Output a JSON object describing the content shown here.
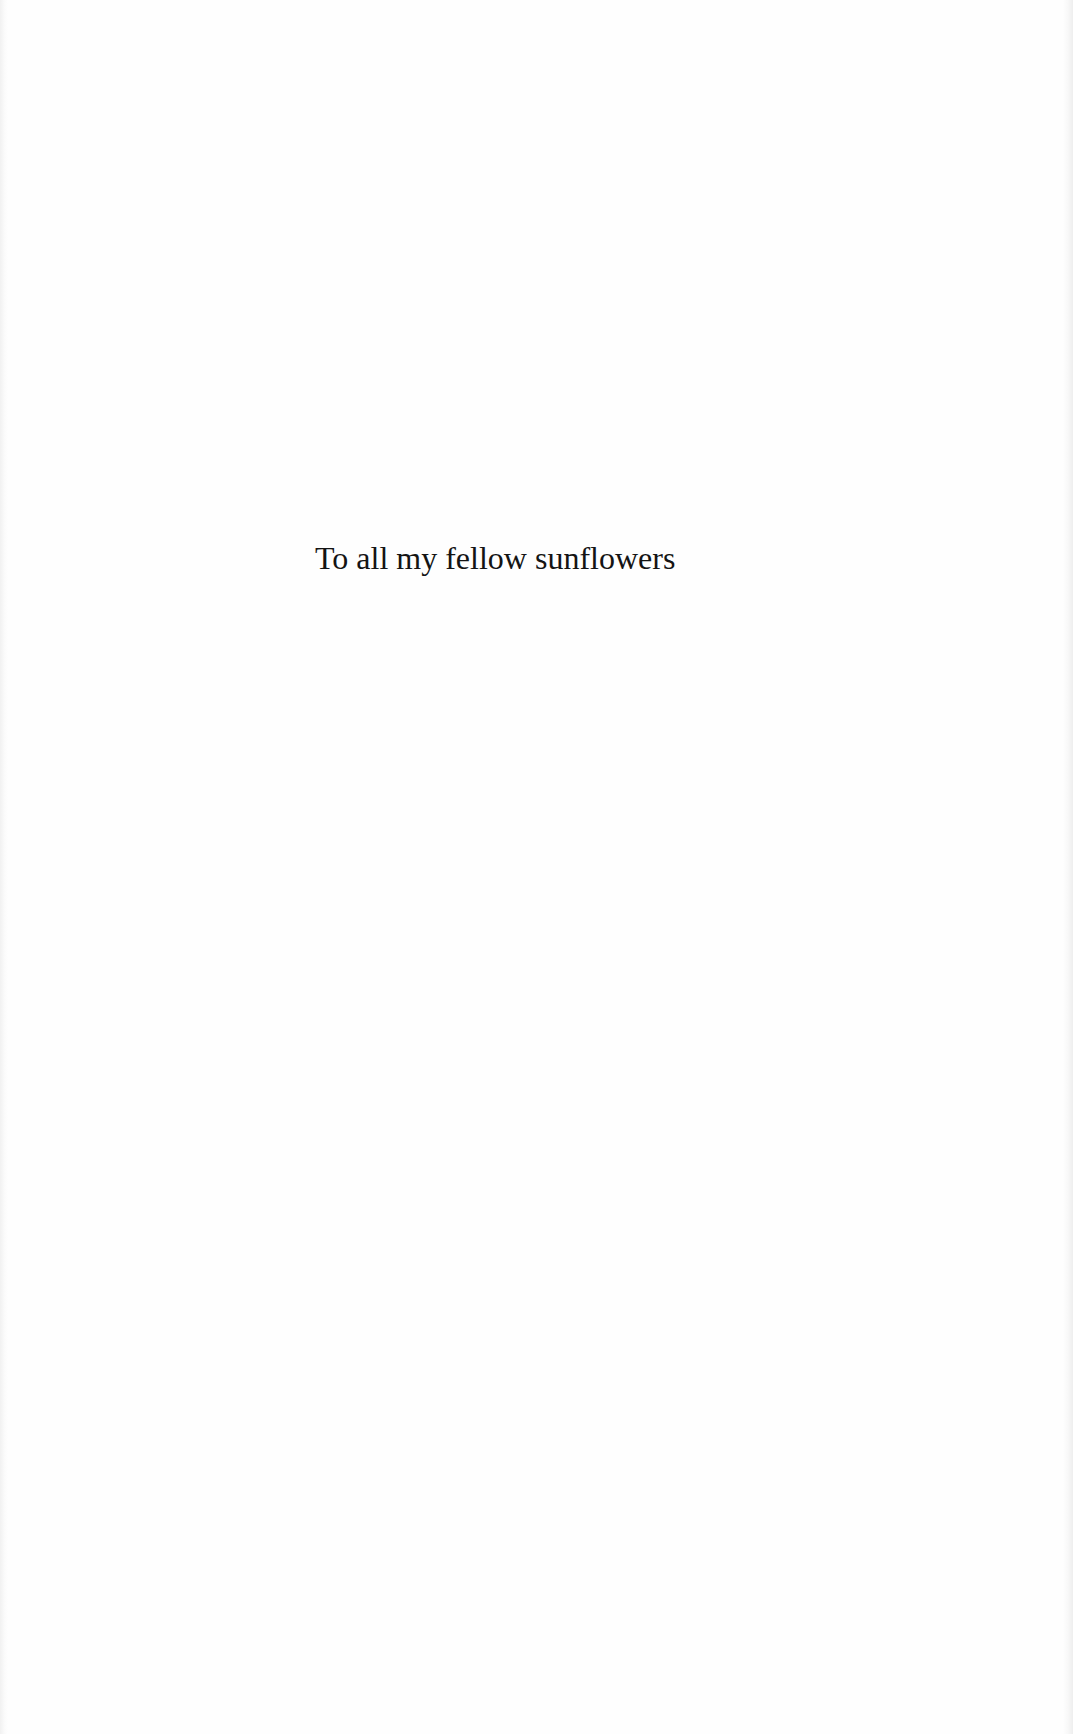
{
  "document": {
    "type": "book dedication page",
    "dedication_text": "To all my fellow sunflowers"
  },
  "colors": {
    "background": "#fefefe",
    "text": "#141414"
  }
}
